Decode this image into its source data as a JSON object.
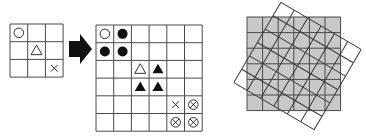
{
  "colors": {
    "line": "#4a4a4a",
    "symbol": "#111111",
    "outline_symbol": "#333333",
    "gray_fill": "#c8c8c8",
    "arrow": "#111111",
    "background": "#ffffff"
  },
  "small_grid": {
    "x": 10,
    "y": 24,
    "cols": 3,
    "rows": 3,
    "cell": 17.7,
    "symbols": [
      {
        "row": 0,
        "col": 0,
        "type": "circle-open"
      },
      {
        "row": 1,
        "col": 1,
        "type": "triangle-open"
      },
      {
        "row": 2,
        "col": 2,
        "type": "cross"
      }
    ]
  },
  "arrow": {
    "shaft": {
      "x1": 69,
      "y1": 41,
      "x2": 81,
      "y2": 57
    },
    "head": [
      [
        80,
        34
      ],
      [
        92,
        49
      ],
      [
        80,
        64
      ]
    ]
  },
  "large_grid": {
    "x": 96,
    "y": 25,
    "cols": 6,
    "rows": 6,
    "cell": 17.7,
    "symbols": [
      {
        "row": 0,
        "col": 0,
        "type": "circle-open"
      },
      {
        "row": 0,
        "col": 1,
        "type": "circle-filled"
      },
      {
        "row": 1,
        "col": 0,
        "type": "circle-filled"
      },
      {
        "row": 1,
        "col": 1,
        "type": "circle-filled"
      },
      {
        "row": 2,
        "col": 2,
        "type": "triangle-open"
      },
      {
        "row": 2,
        "col": 3,
        "type": "triangle-filled"
      },
      {
        "row": 3,
        "col": 2,
        "type": "triangle-filled"
      },
      {
        "row": 3,
        "col": 3,
        "type": "triangle-filled"
      },
      {
        "row": 4,
        "col": 4,
        "type": "cross"
      },
      {
        "row": 4,
        "col": 5,
        "type": "circle-cross"
      },
      {
        "row": 5,
        "col": 4,
        "type": "circle-cross"
      },
      {
        "row": 5,
        "col": 5,
        "type": "circle-cross"
      }
    ]
  },
  "rotated_figure": {
    "base_grid": {
      "x": 247,
      "y": 17,
      "cols": 6,
      "rows": 6,
      "cell": 15.6,
      "fill": "#c8c8c8"
    },
    "rotated_grid": {
      "cx": 297.5,
      "cy": 66,
      "cols": 6,
      "rows": 6,
      "cell": 15.5,
      "angle_deg": 30.4
    }
  }
}
